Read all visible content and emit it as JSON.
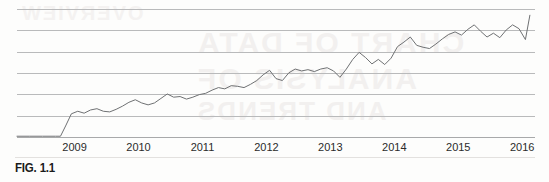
{
  "figure": {
    "caption": "FIG. 1.1",
    "page_background": "#fdfdfc",
    "line_color": "#6f7173",
    "gridline_color": "#b9babb",
    "axis_color": "#a8a9aa",
    "label_color": "#2b2b2b"
  },
  "bleed_through": {
    "line_1": "CHART OF DATA",
    "line_2": "ANALYSIS OF",
    "line_3": "AND TRENDS",
    "line_4": "OVERVIEW"
  },
  "chart_data": {
    "type": "line",
    "title": "",
    "subtitle": "",
    "xlabel": "",
    "ylabel": "",
    "grid": true,
    "grid_lines_y": 6,
    "legend": null,
    "legend_position": "none",
    "tick_labels_x": [
      "2009",
      "2010",
      "2011",
      "2012",
      "2013",
      "2014",
      "2015",
      "2016"
    ],
    "xlim": [
      2008.1,
      2016.2
    ],
    "ylim": [
      0,
      100
    ],
    "annotations": [],
    "series": [
      {
        "name": "index",
        "x": [
          2008.1,
          2008.3,
          2008.5,
          2008.7,
          2008.78,
          2008.86,
          2008.95,
          2009.05,
          2009.15,
          2009.25,
          2009.35,
          2009.45,
          2009.55,
          2009.65,
          2009.75,
          2009.85,
          2009.95,
          2010.05,
          2010.15,
          2010.25,
          2010.35,
          2010.45,
          2010.55,
          2010.65,
          2010.75,
          2010.85,
          2010.95,
          2011.05,
          2011.15,
          2011.25,
          2011.35,
          2011.45,
          2011.55,
          2011.65,
          2011.75,
          2011.85,
          2011.95,
          2012.05,
          2012.15,
          2012.25,
          2012.35,
          2012.45,
          2012.55,
          2012.65,
          2012.75,
          2012.85,
          2012.95,
          2013.05,
          2013.15,
          2013.25,
          2013.35,
          2013.45,
          2013.55,
          2013.65,
          2013.75,
          2013.85,
          2013.95,
          2014.05,
          2014.15,
          2014.25,
          2014.35,
          2014.45,
          2014.55,
          2014.65,
          2014.75,
          2014.85,
          2014.95,
          2015.05,
          2015.15,
          2015.25,
          2015.35,
          2015.45,
          2015.55,
          2015.65,
          2015.75,
          2015.85,
          2015.95,
          2016.05,
          2016.12
        ],
        "y": [
          1.0,
          1.0,
          1.0,
          1.0,
          1.0,
          9.0,
          18.5,
          20.5,
          19.0,
          21.5,
          22.5,
          20.5,
          20.0,
          22.0,
          24.5,
          27.5,
          29.5,
          27.0,
          25.5,
          27.0,
          30.5,
          34.0,
          31.5,
          32.0,
          30.0,
          31.5,
          33.5,
          34.5,
          37.0,
          39.0,
          38.0,
          40.5,
          40.0,
          39.0,
          41.5,
          44.5,
          49.0,
          52.5,
          46.0,
          44.5,
          50.5,
          53.5,
          52.0,
          53.0,
          51.5,
          53.5,
          54.5,
          52.0,
          47.0,
          53.5,
          61.0,
          66.5,
          62.5,
          57.5,
          61.0,
          57.0,
          62.0,
          71.0,
          74.5,
          78.5,
          72.0,
          70.5,
          69.5,
          73.0,
          77.0,
          80.5,
          82.5,
          80.0,
          84.5,
          88.0,
          83.0,
          78.5,
          81.5,
          78.0,
          84.0,
          88.0,
          85.0,
          76.5,
          95.5
        ]
      }
    ]
  }
}
